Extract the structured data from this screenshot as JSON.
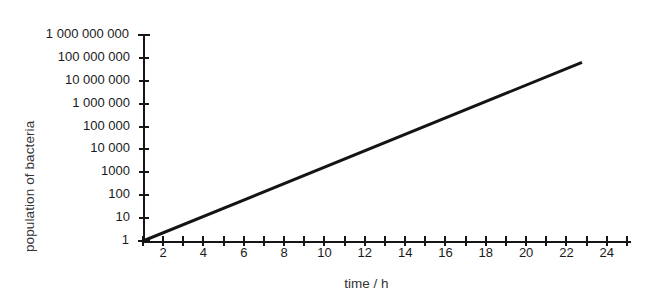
{
  "chart_data": {
    "type": "line",
    "title": "",
    "xlabel": "time / h",
    "ylabel": "population of bacteria",
    "yscale": "log",
    "xlim": [
      1,
      25.2
    ],
    "ylim": [
      1,
      1000000000
    ],
    "grid": false,
    "legend": null,
    "x_tick_step": 1,
    "x_tick_labels": [
      "2",
      "4",
      "6",
      "8",
      "10",
      "12",
      "14",
      "16",
      "18",
      "20",
      "22",
      "24"
    ],
    "x_tick_label_values": [
      2,
      4,
      6,
      8,
      10,
      12,
      14,
      16,
      18,
      20,
      22,
      24
    ],
    "y_tick_labels": [
      "1",
      "10",
      "100",
      "1000",
      "10 000",
      "100 000",
      "1 000 000",
      "10 000 000",
      "100 000 000",
      "1 000 000 000"
    ],
    "y_tick_values": [
      1,
      10,
      100,
      1000,
      10000,
      100000,
      1000000,
      10000000,
      100000000,
      1000000000
    ],
    "series": [
      {
        "name": "population of bacteria",
        "color": "#141414",
        "line_width": 3,
        "x": [
          1,
          22.7
        ],
        "y": [
          1,
          60000000
        ],
        "description": "straight line on semi-log axes: exponential growth"
      }
    ]
  },
  "figure": {
    "background_color": "#ffffff",
    "axis_color": "#161616",
    "text_color": "#1a1a1a"
  }
}
